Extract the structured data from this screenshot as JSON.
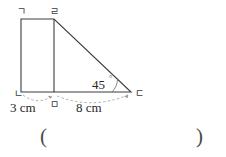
{
  "figure": {
    "name": "trapezoid-with-right-triangle",
    "stroke_color": "#3c3c3c",
    "dash_color": "#9a9a9a",
    "vertices": [
      {
        "id": "a",
        "label": "ㄱ",
        "x": 21,
        "y": 19
      },
      {
        "id": "d",
        "label": "ㄹ",
        "x": 54,
        "y": 19
      },
      {
        "id": "b",
        "label": "ㄴ",
        "x": 21,
        "y": 92
      },
      {
        "id": "m",
        "label": "ㅁ",
        "x": 54,
        "y": 92
      },
      {
        "id": "c",
        "label": "ㄷ",
        "x": 131,
        "y": 92
      }
    ],
    "angle": {
      "value": "45",
      "degree_symbol": "°",
      "at_vertex": "ㄷ"
    },
    "measures": [
      {
        "label": "3 cm",
        "from": "ㄴ",
        "to": "ㅁ"
      },
      {
        "label": "8 cm",
        "from": "ㅁ",
        "to": "ㄷ"
      }
    ]
  },
  "answer_blank": {
    "open": "(",
    "close": ")",
    "value": ""
  }
}
